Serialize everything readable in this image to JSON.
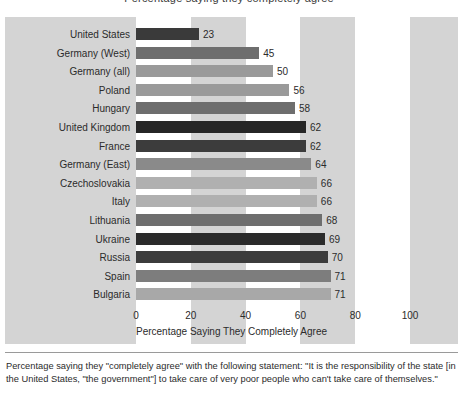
{
  "figure": {
    "cut_title": "Percentage saying they completely agree",
    "axis_title": "Percentage Saying They Completely Agree",
    "footnote": "Percentage saying they \"completely agree\" with the following statement: \"It is the responsibility of the state [in the United States, \"the government\"] to take care of very poor people who can't take care of themselves.\""
  },
  "colors": {
    "panel": "#d4d4d4",
    "band": "#ffffff",
    "text": "#2b2b2b",
    "rule": "#9a9a9a"
  },
  "chart_data": {
    "type": "bar",
    "orientation": "horizontal",
    "title": "",
    "xlabel": "Percentage Saying They Completely Agree",
    "ylabel": "",
    "xlim": [
      0,
      100
    ],
    "xticks": [
      0,
      20,
      40,
      60,
      80,
      100
    ],
    "xtick_labels": [
      "0",
      "20",
      "40",
      "60",
      "80",
      "100"
    ],
    "grid": false,
    "legend": "none",
    "categories": [
      "United States",
      "Germany (West)",
      "Germany (all)",
      "Poland",
      "Hungary",
      "United Kingdom",
      "France",
      "Germany (East)",
      "Czechoslovakia",
      "Italy",
      "Lithuania",
      "Ukraine",
      "Russia",
      "Spain",
      "Bulgaria"
    ],
    "values": [
      23,
      45,
      50,
      56,
      58,
      62,
      62,
      64,
      66,
      66,
      68,
      69,
      70,
      71,
      71
    ],
    "value_labels": [
      "23",
      "45",
      "50",
      "56",
      "58",
      "62",
      "62",
      "64",
      "66",
      "66",
      "68",
      "69",
      "70",
      "71",
      "71"
    ],
    "bar_colors": [
      "#3a3a3a",
      "#6e6e6e",
      "#9a9a9a",
      "#9a9a9a",
      "#6e6e6e",
      "#262626",
      "#3c3c3c",
      "#8a8a8a",
      "#b0b0b0",
      "#b0b0b0",
      "#6e6e6e",
      "#2b2b2b",
      "#3c3c3c",
      "#7d7d7d",
      "#a8a8a8"
    ]
  }
}
